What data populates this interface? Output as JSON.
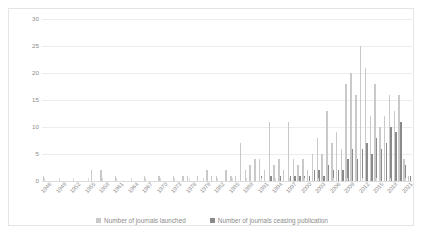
{
  "chart_data": {
    "type": "bar",
    "title": "",
    "xlabel": "",
    "ylabel": "",
    "ylim": [
      0,
      30
    ],
    "ytick_step": 5,
    "ytick_labels": [
      "0",
      "5",
      "10",
      "15",
      "20",
      "25",
      "30"
    ],
    "grid": true,
    "legend_position": "bottom",
    "xtick_interval_years": 3,
    "xtick_labels": [
      "1946",
      "1949",
      "1952",
      "1955",
      "1958",
      "1961",
      "1964",
      "1967",
      "1970",
      "1973",
      "1976",
      "1979",
      "1982",
      "1985",
      "1988",
      "1991",
      "1994",
      "1997",
      "2000",
      "2003",
      "2006",
      "2009",
      "2012",
      "2015",
      "2018",
      "2021"
    ],
    "colors": {
      "launched": "#c9c9c9",
      "ceased": "#8a8a8a",
      "gridline": "#ededed",
      "axis_text": "#8c8c8c",
      "frame_border": "#e4e4e4"
    },
    "categories": [
      1946,
      1947,
      1948,
      1949,
      1950,
      1951,
      1952,
      1953,
      1954,
      1955,
      1956,
      1957,
      1958,
      1959,
      1960,
      1961,
      1962,
      1963,
      1964,
      1965,
      1966,
      1967,
      1968,
      1969,
      1970,
      1971,
      1972,
      1973,
      1974,
      1975,
      1976,
      1977,
      1978,
      1979,
      1980,
      1981,
      1982,
      1983,
      1984,
      1985,
      1986,
      1987,
      1988,
      1989,
      1990,
      1991,
      1992,
      1993,
      1994,
      1995,
      1996,
      1997,
      1998,
      1999,
      2000,
      2001,
      2002,
      2003,
      2004,
      2005,
      2006,
      2007,
      2008,
      2009,
      2010,
      2011,
      2012,
      2013,
      2014,
      2015,
      2016,
      2017,
      2018,
      2019,
      2020,
      2021,
      2022
    ],
    "series": [
      {
        "name": "Number of journals launched",
        "color": "#c9c9c9",
        "values": [
          1,
          0,
          0,
          0,
          0,
          0,
          0,
          0,
          0,
          0,
          2,
          0,
          2,
          0,
          0,
          1,
          0,
          0,
          0,
          0,
          0,
          1,
          0,
          0,
          1,
          0,
          0,
          1,
          0,
          1,
          1,
          0,
          1,
          0,
          2,
          1,
          1,
          0,
          2,
          1,
          1,
          7,
          2,
          3,
          4,
          4,
          2,
          11,
          3,
          4,
          2,
          11,
          4,
          3,
          4,
          2,
          5,
          8,
          5,
          13,
          7,
          9,
          6,
          18,
          20,
          16,
          25,
          21,
          12,
          18,
          10,
          12,
          16,
          13,
          16,
          4,
          1
        ]
      },
      {
        "name": "Number of journals ceasing publication",
        "color": "#8a8a8a",
        "values": [
          0,
          0,
          0,
          0,
          0,
          0,
          0,
          0,
          0,
          0,
          0,
          0,
          0,
          0,
          0,
          0,
          0,
          0,
          0,
          0,
          0,
          0,
          0,
          0,
          0,
          0,
          0,
          0,
          0,
          0,
          0,
          0,
          0,
          0,
          0,
          0,
          0,
          0,
          0,
          0,
          0,
          0,
          0,
          0,
          0,
          1,
          0,
          1,
          0,
          1,
          0,
          1,
          1,
          1,
          1,
          1,
          2,
          2,
          1,
          3,
          2,
          2,
          2,
          4,
          6,
          4,
          6,
          7,
          5,
          8,
          6,
          7,
          10,
          9,
          11,
          3,
          1
        ]
      }
    ]
  },
  "legend": {
    "items": [
      {
        "label": "Number of journals launched"
      },
      {
        "label": "Number of journals ceasing publication"
      }
    ]
  }
}
